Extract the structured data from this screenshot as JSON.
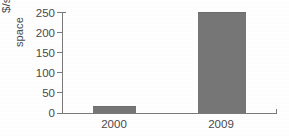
{
  "chart_data": {
    "type": "bar",
    "title": "",
    "xlabel": "",
    "ylabel": "$/sq meter deteriorated space",
    "ylabel_lines": [
      "$/sq meter deteriorated",
      "space"
    ],
    "categories": [
      "2000",
      "2009"
    ],
    "values": [
      17,
      250
    ],
    "series": [
      {
        "name": "",
        "values": [
          17,
          250
        ]
      }
    ],
    "ylim": [
      0,
      250
    ],
    "yticks": [
      0,
      50,
      100,
      150,
      200,
      250
    ],
    "ytick_labels": [
      "0",
      "50",
      "100",
      "150",
      "200",
      "250"
    ],
    "grid": false,
    "legend": false,
    "legend_position": "none",
    "bar_color": "#767676",
    "axis_color": "#7a7a7a",
    "text_color": "#4a4a4a",
    "background_color": "#ffffff"
  }
}
